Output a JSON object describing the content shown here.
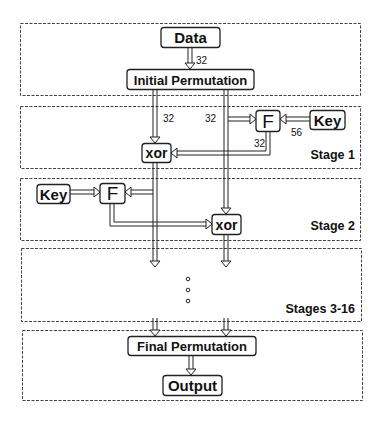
{
  "diagram": {
    "panels": [
      {
        "id": "input",
        "label": ""
      },
      {
        "id": "stage1",
        "label": "Stage 1"
      },
      {
        "id": "stage2",
        "label": "Stage 2"
      },
      {
        "id": "stages3_16",
        "label": "Stages 3-16"
      },
      {
        "id": "output",
        "label": ""
      }
    ],
    "nodes": {
      "data": "Data",
      "initial_permutation": "Initial Permutation",
      "stage1_f": "F",
      "stage1_key": "Key",
      "stage1_xor": "xor",
      "stage2_key": "Key",
      "stage2_f": "F",
      "stage2_xor": "xor",
      "final_permutation": "Final Permutation",
      "output": "Output"
    },
    "bit_widths": {
      "data_to_ip": "32",
      "left_half": "32",
      "right_half": "32",
      "key_to_f": "56",
      "f_out": "32"
    },
    "ellipsis": "..."
  }
}
